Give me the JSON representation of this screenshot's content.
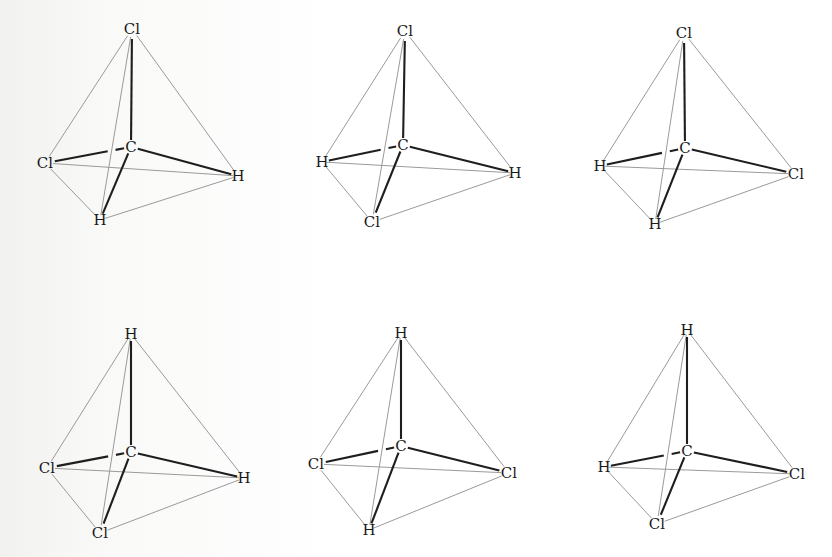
{
  "figure": {
    "colors": {
      "bond": "#1e1e1e",
      "edge": "#9a9a9a",
      "label": "#1a1a1a",
      "background": "#ffffff"
    },
    "molecules": [
      {
        "id": "m1",
        "center": {
          "label": "C",
          "x": 131,
          "y": 147
        },
        "top": {
          "label": "Cl",
          "x": 132,
          "y": 29
        },
        "left": {
          "label": "Cl",
          "x": 45,
          "y": 163
        },
        "right": {
          "label": "H",
          "x": 238,
          "y": 176
        },
        "bottom": {
          "label": "H",
          "x": 100,
          "y": 220
        }
      },
      {
        "id": "m2",
        "center": {
          "label": "C",
          "x": 403,
          "y": 145
        },
        "top": {
          "label": "Cl",
          "x": 405,
          "y": 31
        },
        "left": {
          "label": "H",
          "x": 322,
          "y": 162
        },
        "right": {
          "label": "H",
          "x": 515,
          "y": 173
        },
        "bottom": {
          "label": "Cl",
          "x": 372,
          "y": 222
        }
      },
      {
        "id": "m3",
        "center": {
          "label": "C",
          "x": 685,
          "y": 148
        },
        "top": {
          "label": "Cl",
          "x": 684,
          "y": 33
        },
        "left": {
          "label": "H",
          "x": 600,
          "y": 166
        },
        "right": {
          "label": "Cl",
          "x": 796,
          "y": 174
        },
        "bottom": {
          "label": "H",
          "x": 655,
          "y": 224
        }
      },
      {
        "id": "m4",
        "center": {
          "label": "C",
          "x": 131,
          "y": 452
        },
        "top": {
          "label": "H",
          "x": 131,
          "y": 334
        },
        "left": {
          "label": "Cl",
          "x": 47,
          "y": 468
        },
        "right": {
          "label": "H",
          "x": 244,
          "y": 478
        },
        "bottom": {
          "label": "Cl",
          "x": 100,
          "y": 533
        }
      },
      {
        "id": "m5",
        "center": {
          "label": "C",
          "x": 401,
          "y": 446
        },
        "top": {
          "label": "H",
          "x": 401,
          "y": 333
        },
        "left": {
          "label": "Cl",
          "x": 316,
          "y": 464
        },
        "right": {
          "label": "Cl",
          "x": 509,
          "y": 473
        },
        "bottom": {
          "label": "H",
          "x": 369,
          "y": 530
        }
      },
      {
        "id": "m6",
        "center": {
          "label": "C",
          "x": 687,
          "y": 451
        },
        "top": {
          "label": "H",
          "x": 687,
          "y": 330
        },
        "left": {
          "label": "H",
          "x": 604,
          "y": 467
        },
        "right": {
          "label": "Cl",
          "x": 797,
          "y": 474
        },
        "bottom": {
          "label": "Cl",
          "x": 657,
          "y": 524
        }
      }
    ]
  }
}
